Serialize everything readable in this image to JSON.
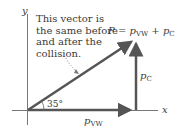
{
  "diagram": {
    "axes": {
      "x_label": "x",
      "y_label": "y"
    },
    "annotation": {
      "lines": [
        "This vector is",
        "the same before",
        "and after the",
        "collision."
      ]
    },
    "equation": {
      "lhs": "P",
      "eq": "=",
      "term1": "p",
      "term1_sub": "VW",
      "plus": "+",
      "term2": "p",
      "term2_sub": "C"
    },
    "vectors": [
      {
        "name": "P",
        "label": "P",
        "sub": "",
        "color": "#555555",
        "direction": "diagonal 35°"
      },
      {
        "name": "p_vw",
        "label": "p",
        "sub": "VW",
        "color": "#555555",
        "direction": "+x"
      },
      {
        "name": "p_c",
        "label": "p",
        "sub": "C",
        "color": "#555555",
        "direction": "+y"
      }
    ],
    "angle": {
      "value": "35°"
    }
  }
}
